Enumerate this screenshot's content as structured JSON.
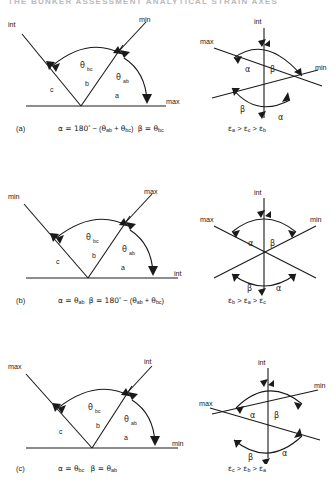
{
  "header": {
    "text": "THE BUNKER ASSESSMENT ANALYTICAL STRAIN AXES",
    "visible": "faint-cropped-running-head"
  },
  "figure": {
    "type": "technical-diagram",
    "line_color": "#1a1a1a",
    "background": "#ffffff"
  },
  "rows": [
    {
      "id": "a",
      "label": "(a)",
      "left_diagram": {
        "name": "fan-diagram-a",
        "baseline": true,
        "rays": [
          {
            "axis": "c",
            "tip_label": "int",
            "direction": "upper-left"
          },
          {
            "axis": "b",
            "tip_label": "min",
            "direction": "upper-right"
          },
          {
            "axis": "a",
            "tip_label": "max",
            "direction": "right-horizontal"
          }
        ],
        "axis_labels": [
          "c",
          "b",
          "a"
        ],
        "angles": [
          {
            "symbol": "θ",
            "subscript": "bc"
          },
          {
            "symbol": "θ",
            "subscript": "ab"
          }
        ]
      },
      "right_diagram": {
        "name": "stereonet-a",
        "vertical_label": "int",
        "left_label": "max",
        "right_label": "min",
        "angle_labels_top": [
          "α",
          "β"
        ],
        "angle_labels_bottom": [
          "β",
          "α"
        ],
        "style": "asymmetric-crossing-lines"
      },
      "formula": {
        "alpha": "α = 180° − (θab + θbc)",
        "beta": "β = θbc",
        "alpha_prefix": "α = 180",
        "alpha_deg": "°",
        "alpha_tail_open": " − (",
        "theta1": "θ",
        "theta1_sub": "ab",
        "plus": " + ",
        "theta2": "θ",
        "theta2_sub": "bc",
        "close": ")",
        "beta_prefix": "β = ",
        "beta_theta": "θ",
        "beta_sub": "bc"
      },
      "epsilon": {
        "text": "εa > εc > εb",
        "terms": [
          {
            "sym": "ε",
            "sub": "a"
          },
          {
            "op": ">"
          },
          {
            "sym": "ε",
            "sub": "c"
          },
          {
            "op": ">"
          },
          {
            "sym": "ε",
            "sub": "b"
          }
        ]
      }
    },
    {
      "id": "b",
      "label": "(b)",
      "left_diagram": {
        "name": "fan-diagram-b",
        "baseline": true,
        "rays": [
          {
            "axis": "c",
            "tip_label": "min",
            "direction": "upper-left"
          },
          {
            "axis": "b",
            "tip_label": "max",
            "direction": "upper-right"
          },
          {
            "axis": "a",
            "tip_label": "int",
            "direction": "right-horizontal"
          }
        ],
        "axis_labels": [
          "c",
          "b",
          "a"
        ],
        "angles": [
          {
            "symbol": "θ",
            "subscript": "bc"
          },
          {
            "symbol": "θ",
            "subscript": "ab"
          }
        ]
      },
      "right_diagram": {
        "name": "stereonet-b",
        "vertical_label": "int",
        "left_label": "max",
        "right_label": "min",
        "angle_labels_top": [
          "α",
          "β"
        ],
        "angle_labels_bottom": [
          "β",
          "α"
        ],
        "style": "symmetric-crossing-lines"
      },
      "formula": {
        "alpha_prefix": "α = ",
        "alpha_theta": "θ",
        "alpha_sub": "ab",
        "beta_prefix": "β = 180",
        "beta_deg": "°",
        "beta_tail_open": " − (",
        "theta1": "θ",
        "theta1_sub": "ab",
        "plus": " + ",
        "theta2": "θ",
        "theta2_sub": "bc",
        "close": ")"
      },
      "epsilon": {
        "text": "εb > εa > εc",
        "terms": [
          {
            "sym": "ε",
            "sub": "b"
          },
          {
            "op": ">"
          },
          {
            "sym": "ε",
            "sub": "a"
          },
          {
            "op": ">"
          },
          {
            "sym": "ε",
            "sub": "c"
          }
        ]
      }
    },
    {
      "id": "c",
      "label": "(c)",
      "left_diagram": {
        "name": "fan-diagram-c",
        "baseline": true,
        "rays": [
          {
            "axis": "c",
            "tip_label": "max",
            "direction": "upper-left"
          },
          {
            "axis": "b",
            "tip_label": "int",
            "direction": "upper-right"
          },
          {
            "axis": "a",
            "tip_label": "min",
            "direction": "right-horizontal"
          }
        ],
        "axis_labels": [
          "c",
          "b",
          "a"
        ],
        "angles": [
          {
            "symbol": "θ",
            "subscript": "bc"
          },
          {
            "symbol": "θ",
            "subscript": "ab"
          }
        ]
      },
      "right_diagram": {
        "name": "stereonet-c",
        "vertical_label": "int",
        "left_label": "max",
        "right_label": "min",
        "angle_labels_top": [
          "α",
          "β"
        ],
        "angle_labels_bottom": [
          "β",
          "α"
        ],
        "style": "asymmetric-crossing-lines-mirrored"
      },
      "formula": {
        "alpha_prefix": "α = ",
        "alpha_theta": "θ",
        "alpha_sub": "bc",
        "beta_prefix": "β = ",
        "beta_theta": "θ",
        "beta_sub": "ab"
      },
      "epsilon": {
        "text": "εc > εb > εa",
        "terms": [
          {
            "sym": "ε",
            "sub": "c"
          },
          {
            "op": ">"
          },
          {
            "sym": "ε",
            "sub": "b"
          },
          {
            "op": ">"
          },
          {
            "sym": "ε",
            "sub": "a"
          }
        ]
      }
    }
  ],
  "glyphs": {
    "theta": "θ",
    "alpha": "α",
    "beta": "β",
    "epsilon": "ε",
    "degree": "°",
    "minus": "−",
    "gt": ">"
  }
}
